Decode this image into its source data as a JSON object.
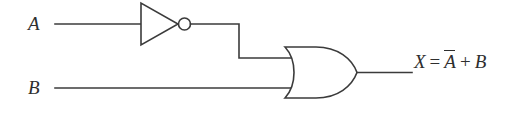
{
  "diagram": {
    "kind": "logic-circuit-schematic",
    "width": 528,
    "height": 121,
    "background_color": "#ffffff",
    "line_color": "#3b3b3b",
    "text_color": "#2e2e2e",
    "inputs": [
      {
        "id": "a",
        "label": "A",
        "wire_y": 24
      },
      {
        "id": "b",
        "label": "B",
        "wire_y": 88
      }
    ],
    "gates": [
      {
        "id": "inverter",
        "type": "NOT",
        "name": "inverter-gate",
        "has_inversion_bubble": true,
        "input_signal": "A",
        "output_signal": "A-bar"
      },
      {
        "id": "or",
        "type": "OR",
        "name": "or-gate",
        "has_inversion_bubble": false,
        "input_signals": [
          "A-bar",
          "B"
        ],
        "output_signal": "X"
      }
    ],
    "output": {
      "label_full": "X = A + B",
      "variable": "X",
      "equals": "=",
      "operand_negated": "A",
      "operator": "+",
      "operand_plain": "B",
      "wire_y": 72
    }
  }
}
